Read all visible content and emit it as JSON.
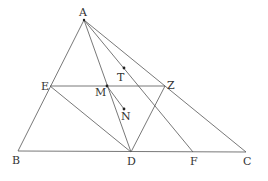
{
  "diagram": {
    "points": {
      "A": {
        "label": "A",
        "x": 84,
        "y": 20
      },
      "B": {
        "label": "B",
        "x": 18,
        "y": 151
      },
      "C": {
        "label": "C",
        "x": 246,
        "y": 152
      },
      "D": {
        "label": "D",
        "x": 131,
        "y": 152
      },
      "F": {
        "label": "F",
        "x": 193,
        "y": 152
      },
      "E": {
        "label": "E",
        "x": 50,
        "y": 86
      },
      "Z": {
        "label": "Z",
        "x": 165,
        "y": 86
      },
      "M": {
        "label": "M",
        "x": 107,
        "y": 86
      },
      "T": {
        "label": "T",
        "x": 124,
        "y": 68
      },
      "N": {
        "label": "N",
        "x": 124,
        "y": 109
      }
    },
    "segments": [
      [
        "A",
        "B"
      ],
      [
        "A",
        "C"
      ],
      [
        "B",
        "C"
      ],
      [
        "A",
        "D"
      ],
      [
        "A",
        "F"
      ],
      [
        "E",
        "Z"
      ],
      [
        "E",
        "D"
      ],
      [
        "Z",
        "D"
      ],
      [
        "M",
        "N"
      ]
    ],
    "marked_points": [
      "M",
      "T",
      "N"
    ]
  }
}
